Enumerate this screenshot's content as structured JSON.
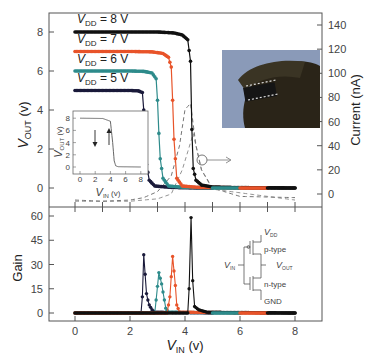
{
  "chart_data": [
    {
      "panel": "top",
      "type": "line",
      "xlabel": "V_IN (v)",
      "ylabel": "V_OUT (v)",
      "y2label": "Current (nA)",
      "xlim": [
        -1,
        9
      ],
      "ylim": [
        -0.6,
        9
      ],
      "y2lim": [
        0,
        145
      ],
      "yticks": [
        0,
        2,
        4,
        6,
        8
      ],
      "y2ticks": [
        0,
        20,
        40,
        60,
        80,
        100,
        120,
        140
      ],
      "legend": [
        "V_DD = 8 V",
        "V_DD = 7 V",
        "V_DD = 6 V",
        "V_DD = 5 V"
      ],
      "series": [
        {
          "name": "V_DD = 8 V",
          "color": "#111111",
          "x": [
            0,
            1,
            2,
            3,
            3.6,
            3.9,
            4.1,
            4.2,
            4.25,
            4.3,
            4.4,
            4.6,
            5,
            6,
            7,
            8
          ],
          "y": [
            8,
            8,
            8,
            8,
            7.95,
            7.85,
            7.6,
            6.5,
            3,
            1,
            0.4,
            0.15,
            0.05,
            0.02,
            0.01,
            0
          ]
        },
        {
          "name": "V_DD = 7 V",
          "color": "#e8542a",
          "x": [
            0,
            1,
            2,
            2.8,
            3.2,
            3.4,
            3.5,
            3.55,
            3.6,
            3.7,
            3.9,
            4.5,
            6,
            7
          ],
          "y": [
            7,
            7,
            7,
            6.98,
            6.9,
            6.7,
            6.2,
            4.5,
            2.5,
            0.5,
            0.1,
            0.03,
            0.01,
            0
          ]
        },
        {
          "name": "V_DD = 6 V",
          "color": "#2e8b8b",
          "x": [
            0,
            1,
            2,
            2.5,
            2.8,
            2.95,
            3.0,
            3.05,
            3.1,
            3.2,
            3.4,
            4,
            5,
            6
          ],
          "y": [
            6,
            6,
            6,
            5.98,
            5.9,
            5.6,
            4.5,
            2.8,
            1.5,
            0.5,
            0.1,
            0.03,
            0.01,
            0
          ]
        },
        {
          "name": "V_DD = 5 V",
          "color": "#1a1a3a",
          "x": [
            0,
            1,
            2,
            2.3,
            2.45,
            2.5,
            2.55,
            2.6,
            2.7,
            2.9,
            3.5,
            4,
            5
          ],
          "y": [
            5,
            5,
            5,
            4.98,
            4.9,
            4,
            2.5,
            1.2,
            0.4,
            0.1,
            0.03,
            0.01,
            0
          ]
        }
      ],
      "current_series": {
        "name": "Current (dashed)",
        "style": "dashed",
        "x": [
          0,
          1,
          2,
          2.5,
          3,
          3.5,
          3.8,
          4.0,
          4.2,
          4.4,
          4.6,
          5,
          6,
          8
        ],
        "y": [
          -5,
          -6,
          -5,
          -3,
          2,
          15,
          40,
          70,
          75,
          40,
          20,
          5,
          -2,
          -3
        ]
      },
      "annotations": [
        "circle with arrow pointing right to Current axis"
      ],
      "inset_plot": {
        "xlabel": "V_IN (v)",
        "ylabel": "V_OUT (v)",
        "xticks": [
          0,
          2,
          4,
          6,
          8
        ],
        "yticks": [
          0,
          2,
          4,
          6,
          8
        ],
        "x": [
          0,
          3,
          4,
          4.3,
          4.5,
          4.7,
          5,
          8
        ],
        "y": [
          8,
          7.95,
          7.5,
          4,
          1,
          0.2,
          0.05,
          0
        ],
        "arrows": [
          "down",
          "up"
        ]
      },
      "inset_photo": "photo of flexible device held between fingers"
    },
    {
      "panel": "bottom",
      "type": "line",
      "xlabel": "V_IN (v)",
      "ylabel": "Gain",
      "xticks": [
        0,
        2,
        4,
        6,
        8
      ],
      "yticks": [
        0,
        15,
        30,
        45,
        60
      ],
      "xlim": [
        -1,
        9
      ],
      "ylim": [
        -5,
        63
      ],
      "series": [
        {
          "name": "V_DD = 5 V",
          "color": "#1a1a3a",
          "x": [
            0,
            2.4,
            2.45,
            2.5,
            2.55,
            2.6,
            2.65,
            2.7,
            2.8,
            2.9,
            5
          ],
          "y": [
            0,
            0,
            10,
            36,
            24,
            12,
            8,
            5,
            2,
            0.5,
            0
          ]
        },
        {
          "name": "V_DD = 6 V",
          "color": "#2e8b8b",
          "x": [
            0,
            2.9,
            2.95,
            3.05,
            3.15,
            3.25,
            3.3,
            3.4,
            6
          ],
          "y": [
            0,
            0,
            8,
            25,
            18,
            8,
            3,
            0.5,
            0
          ]
        },
        {
          "name": "V_DD = 7 V",
          "color": "#e8542a",
          "x": [
            0,
            3.35,
            3.45,
            3.55,
            3.65,
            3.7,
            3.8,
            7
          ],
          "y": [
            0,
            0,
            10,
            35,
            17,
            5,
            0.5,
            0
          ]
        },
        {
          "name": "V_DD = 8 V",
          "color": "#111111",
          "x": [
            0,
            4.1,
            4.15,
            4.22,
            4.28,
            4.35,
            4.5,
            4.8,
            8
          ],
          "y": [
            0,
            0,
            15,
            59,
            20,
            4,
            2,
            0.5,
            0
          ]
        }
      ],
      "inset_schematic": {
        "labels": [
          "V_DD",
          "p-type",
          "V_IN",
          "V_OUT",
          "n-type",
          "GND"
        ]
      }
    }
  ],
  "labels": {
    "legend_8": "V",
    "legend_8_sub": "DD",
    "legend_8_val": " = 8 V",
    "legend_7_val": " = 7 V",
    "legend_6_val": " = 6 V",
    "legend_5_val": " = 5 V",
    "ylabel_top_main": "V",
    "ylabel_top_sub": "OUT",
    "ylabel_top_unit": " (v)",
    "ylabel_right": "Current (nA)",
    "ylabel_bottom": "Gain",
    "xlabel_main": "V",
    "xlabel_sub": "IN",
    "xlabel_unit": " (v)",
    "schematic_vdd": "V",
    "schematic_vdd_sub": "DD",
    "schematic_ptype": "p-type",
    "schematic_vin": "V",
    "schematic_vin_sub": "IN",
    "schematic_vout": "V",
    "schematic_vout_sub": "OUT",
    "schematic_ntype": "n-type",
    "schematic_gnd": "GND"
  }
}
